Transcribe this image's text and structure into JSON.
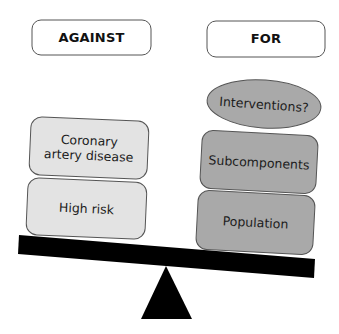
{
  "diagram": {
    "type": "balance-scale",
    "colors": {
      "against_fill": "#e3e3e3",
      "for_fill": "#a9a9a9",
      "outline": "#555555",
      "beam": "#000000",
      "fulcrum": "#000000",
      "header_fill": "#ffffff"
    },
    "headers": {
      "against": "AGAINST",
      "for": "FOR"
    },
    "against_items": [
      {
        "label": "Coronary artery disease"
      },
      {
        "label": "High risk"
      }
    ],
    "for_items": [
      {
        "label": "Interventions?",
        "shape": "ellipse"
      },
      {
        "label": "Subcomponents",
        "shape": "rounded-rect"
      },
      {
        "label": "Population",
        "shape": "rounded-rect"
      }
    ]
  }
}
